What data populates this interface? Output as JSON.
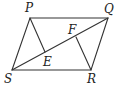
{
  "diagram": {
    "type": "geometry",
    "shape": "parallelogram PQRS with diagonal SQ and segments PE, RF",
    "points": {
      "P": {
        "x": 30,
        "y": 18
      },
      "Q": {
        "x": 108,
        "y": 18
      },
      "R": {
        "x": 91,
        "y": 70
      },
      "S": {
        "x": 12,
        "y": 70
      },
      "E": {
        "x": 45,
        "y": 52
      },
      "F": {
        "x": 76,
        "y": 37
      }
    },
    "labels": {
      "P": "P",
      "Q": "Q",
      "R": "R",
      "S": "S",
      "E": "E",
      "F": "F"
    },
    "colors": {
      "line": "#333333",
      "text": "#222222",
      "background": "#ffffff"
    }
  }
}
